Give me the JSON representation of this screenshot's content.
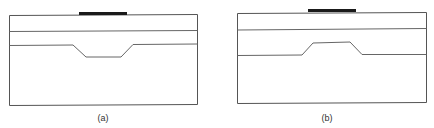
{
  "figure": {
    "panels": [
      {
        "id": "a",
        "caption": "(a)",
        "description": "Layered structure with electrode on top; lower interface has a recessed trapezoidal trough beneath the electrode",
        "feature": "trough"
      },
      {
        "id": "b",
        "caption": "(b)",
        "description": "Layered structure with electrode on top; lower interface has a raised trapezoidal ridge beneath the electrode",
        "feature": "ridge"
      }
    ],
    "colors": {
      "electrode": "#1a1a1a",
      "lines": "#555555"
    }
  }
}
